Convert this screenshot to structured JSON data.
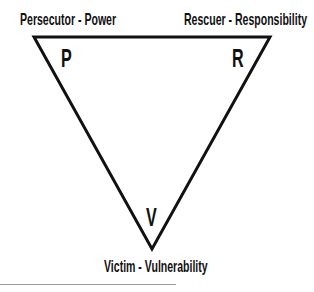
{
  "diagram": {
    "type": "drama-triangle",
    "vertices": [
      {
        "role": "Persecutor",
        "quality": "Power",
        "label": "Persecutor - Power",
        "letter": "P"
      },
      {
        "role": "Rescuer",
        "quality": "Responsibility",
        "label": "Rescuer - Responsibility",
        "letter": "R"
      },
      {
        "role": "Victim",
        "quality": "Vulnerability",
        "label": "Victim - Vulnerability",
        "letter": "V"
      }
    ],
    "colors": {
      "line": "#111111",
      "text": "#111111",
      "rule": "#9a9a9a"
    }
  }
}
